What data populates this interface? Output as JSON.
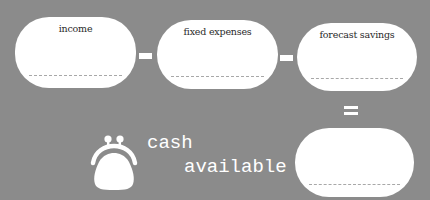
{
  "colors": {
    "background": "#8b8b8b",
    "box": "#ffffff",
    "text": "#2a2a2a",
    "dash": "#a8a8a8"
  },
  "equation": {
    "boxes": [
      {
        "label": "income",
        "value": ""
      },
      {
        "label": "fixed expenses",
        "value": ""
      },
      {
        "label": "forecast savings",
        "value": ""
      }
    ],
    "operators": [
      "minus",
      "minus",
      "equals"
    ],
    "result": {
      "label": "",
      "value": ""
    }
  },
  "caption": {
    "line1": "cash",
    "line2": "available",
    "icon": "purse-icon"
  }
}
